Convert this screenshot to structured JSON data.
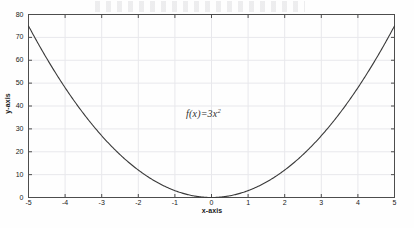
{
  "figure": {
    "background_color": "#fefefe",
    "frame_color": "#4d4d4d",
    "grid_color": "#e8e8ec",
    "curve_color": "#3a3a3a",
    "text_color": "#1a1a1a"
  },
  "chart_data": {
    "type": "line",
    "title": "",
    "subtitle": "",
    "xlabel": "x-axis",
    "ylabel": "y-axis",
    "xlim": [
      -5,
      5
    ],
    "ylim": [
      0,
      80
    ],
    "xticks": [
      -5,
      -4,
      -3,
      -2,
      -1,
      0,
      1,
      2,
      3,
      4,
      5
    ],
    "xticklabels": [
      "-5",
      "-4",
      "-3",
      "-2",
      "-1",
      "0",
      "1",
      "2",
      "3",
      "4",
      "5"
    ],
    "yticks": [
      0,
      10,
      20,
      30,
      40,
      50,
      60,
      70,
      80
    ],
    "yticklabels": [
      "0",
      "10",
      "20",
      "30",
      "40",
      "50",
      "60",
      "70",
      "80"
    ],
    "grid": true,
    "legend": null,
    "annotations": [
      {
        "name": "function-equation",
        "text_base": "f(x)=3x",
        "text_exponent": "2",
        "text_plain": "f(x)=3x^2",
        "x": 0.05,
        "y": 37
      }
    ],
    "series": [
      {
        "name": "f(x)=3x^2",
        "equation": "y = 3 * x^2",
        "color": "#3a3a3a",
        "linewidth": 1.1,
        "x": [
          -5,
          -4.75,
          -4.5,
          -4.25,
          -4,
          -3.75,
          -3.5,
          -3.25,
          -3,
          -2.75,
          -2.5,
          -2.25,
          -2,
          -1.75,
          -1.5,
          -1.25,
          -1,
          -0.75,
          -0.5,
          -0.25,
          0,
          0.25,
          0.5,
          0.75,
          1,
          1.25,
          1.5,
          1.75,
          2,
          2.25,
          2.5,
          2.75,
          3,
          3.25,
          3.5,
          3.75,
          4,
          4.25,
          4.5,
          4.75,
          5
        ],
        "y": [
          75,
          67.6875,
          60.75,
          54.1875,
          48,
          42.1875,
          36.75,
          31.6875,
          27,
          22.6875,
          18.75,
          15.1875,
          12,
          9.1875,
          6.75,
          4.6875,
          3,
          1.6875,
          0.75,
          0.1875,
          0,
          0.1875,
          0.75,
          1.6875,
          3,
          4.6875,
          6.75,
          9.1875,
          12,
          15.1875,
          18.75,
          22.6875,
          27,
          31.6875,
          36.75,
          42.1875,
          48,
          54.1875,
          60.75,
          67.6875,
          75
        ]
      }
    ]
  }
}
